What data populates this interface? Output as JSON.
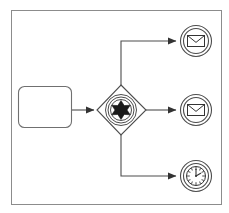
{
  "diagram": {
    "kind": "bpmn-process-fragment",
    "title": "",
    "canvas": {
      "width": 229,
      "height": 213,
      "background_color": "#ffffff",
      "border_color": "#808080",
      "border_width": 1,
      "frame": {
        "x": 11,
        "y": 10,
        "width": 211,
        "height": 195
      }
    },
    "style": {
      "stroke_color": "#4d4d4d",
      "marker_fill": "#1a1a1a",
      "shape_fill": "#ffffff",
      "stroke_width": 1
    },
    "nodes": [
      {
        "id": "task-1",
        "data_name": "task-activity",
        "type": "task",
        "shape": "rounded-rectangle",
        "label": "",
        "x": 18,
        "y": 86,
        "width": 54,
        "height": 42,
        "corner_radius": 6
      },
      {
        "id": "gateway-1",
        "data_name": "event-based-gateway",
        "type": "gateway",
        "gateway_kind": "event-based-multiple",
        "shape": "diamond",
        "marker": "multiple-event-star",
        "label": "",
        "cx": 121,
        "cy": 110,
        "half_width": 24,
        "half_height": 25,
        "inner_circle_radii": [
          15,
          13,
          11
        ]
      },
      {
        "id": "event-1",
        "data_name": "intermediate-message-event-top",
        "type": "intermediate-catch-event",
        "event_kind": "message",
        "marker": "envelope-icon",
        "label": "",
        "cx": 196,
        "cy": 41,
        "outer_radius": 16,
        "inner_radius": 13
      },
      {
        "id": "event-2",
        "data_name": "intermediate-message-event-middle",
        "type": "intermediate-catch-event",
        "event_kind": "message",
        "marker": "envelope-icon",
        "label": "",
        "cx": 196,
        "cy": 110,
        "outer_radius": 16,
        "inner_radius": 13
      },
      {
        "id": "event-3",
        "data_name": "intermediate-timer-event-bottom",
        "type": "intermediate-catch-event",
        "event_kind": "timer",
        "marker": "clock-icon",
        "label": "",
        "clock_hour_hand": 2,
        "clock_minute_hand": 12,
        "cx": 196,
        "cy": 176,
        "outer_radius": 16,
        "inner_radius": 13
      }
    ],
    "connectors": [
      {
        "id": "flow-1",
        "data_name": "sequence-flow-task-to-gateway",
        "from": "task-1",
        "to": "gateway-1",
        "label": "",
        "path": "M 72 110 L 95 110",
        "arrowhead": true
      },
      {
        "id": "flow-2",
        "data_name": "sequence-flow-gateway-to-message-top",
        "from": "gateway-1",
        "to": "event-1",
        "label": "",
        "path": "M 121 85 L 121 41 L 177 41",
        "arrowhead": true
      },
      {
        "id": "flow-3",
        "data_name": "sequence-flow-gateway-to-message-middle",
        "from": "gateway-1",
        "to": "event-2",
        "label": "",
        "path": "M 146 110 L 177 110",
        "arrowhead": true
      },
      {
        "id": "flow-4",
        "data_name": "sequence-flow-gateway-to-timer-bottom",
        "from": "gateway-1",
        "to": "event-3",
        "label": "",
        "path": "M 121 135 L 121 176 L 177 176",
        "arrowhead": true
      }
    ]
  }
}
